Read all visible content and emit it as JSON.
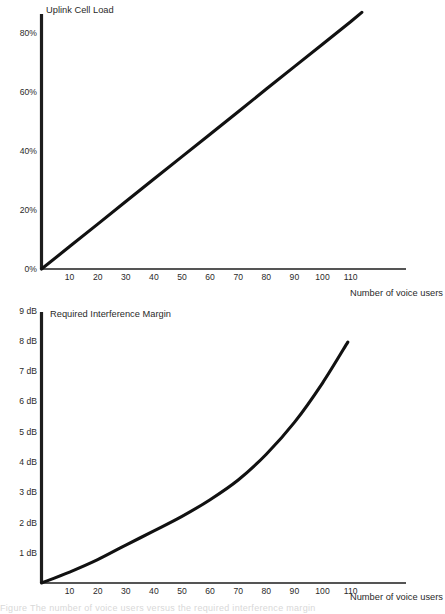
{
  "page": {
    "background": "#ffffff",
    "ink": "#111111",
    "width": 445,
    "height": 614,
    "caption_sliver": "Figure  The number of voice users  versus the  required interference margin"
  },
  "charts": [
    {
      "id": "uplink-cell-load",
      "title": "Uplink Cell Load",
      "xlabel": "Number of voice users",
      "ylabel": "",
      "y_ticks": [
        "0%",
        "20%",
        "40%",
        "60%",
        "80%"
      ],
      "y_tick_values": [
        0,
        20,
        40,
        60,
        80
      ],
      "x_ticks": [
        "10",
        "20",
        "30",
        "40",
        "50",
        "60",
        "70",
        "80",
        "90",
        "100",
        "110"
      ],
      "x_tick_values": [
        10,
        20,
        30,
        40,
        50,
        60,
        70,
        80,
        90,
        100,
        110
      ],
      "xlim": [
        0,
        130
      ],
      "ylim": [
        0,
        91
      ]
    },
    {
      "id": "required-interference-margin",
      "title": "Required Interference Margin",
      "xlabel": "Number of voice users",
      "ylabel": "",
      "y_ticks": [
        "1 dB",
        "2 dB",
        "3 dB",
        "4 dB",
        "5 dB",
        "6 dB",
        "7 dB",
        "8 dB",
        "9 dB"
      ],
      "y_tick_values": [
        1,
        2,
        3,
        4,
        5,
        6,
        7,
        8,
        9
      ],
      "x_ticks": [
        "10",
        "20",
        "30",
        "40",
        "50",
        "60",
        "70",
        "80",
        "90",
        "100",
        "110"
      ],
      "x_tick_values": [
        10,
        20,
        30,
        40,
        50,
        60,
        70,
        80,
        90,
        100,
        110
      ],
      "xlim": [
        0,
        130
      ],
      "ylim": [
        0,
        9.3
      ]
    }
  ],
  "chart_data": [
    {
      "type": "line",
      "id": "uplink-cell-load",
      "title": "Uplink Cell Load",
      "xlabel": "Number of voice users",
      "ylabel": "Uplink Cell Load (%)",
      "xlim": [
        0,
        130
      ],
      "ylim": [
        0,
        91
      ],
      "grid": false,
      "legend": "none",
      "x": [
        0,
        10,
        20,
        30,
        40,
        50,
        60,
        70,
        80,
        90,
        100,
        110,
        114
      ],
      "series": [
        {
          "name": "Uplink Cell Load",
          "values": [
            0,
            7.6,
            15.2,
            22.9,
            30.5,
            38.1,
            45.7,
            53.3,
            61.0,
            68.6,
            76.2,
            83.8,
            87.0
          ]
        }
      ],
      "annotations": []
    },
    {
      "type": "line",
      "id": "required-interference-margin",
      "title": "Required Interference Margin",
      "xlabel": "Number of voice users",
      "ylabel": "Required Interference Margin (dB)",
      "xlim": [
        0,
        130
      ],
      "ylim": [
        0,
        9.3
      ],
      "grid": false,
      "legend": "none",
      "x": [
        0,
        10,
        20,
        30,
        40,
        50,
        60,
        70,
        80,
        90,
        100,
        109
      ],
      "series": [
        {
          "name": "Required Interference Margin",
          "values": [
            0,
            0.36,
            0.77,
            1.25,
            1.72,
            2.2,
            2.75,
            3.4,
            4.25,
            5.3,
            6.6,
            7.95
          ]
        }
      ],
      "annotations": []
    }
  ]
}
